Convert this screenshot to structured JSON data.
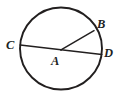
{
  "figure": {
    "kind": "circle-geometry-diagram",
    "background_color": "#ffffff",
    "stroke_color": "#221f1f",
    "canvas": {
      "width": 120,
      "height": 94
    },
    "circle": {
      "name": "circle-A",
      "center_x": 61,
      "center_y": 48.5,
      "radius": 41,
      "stroke_width": 1.9
    },
    "segments": [
      {
        "name": "diameter-CD",
        "from_label": "C",
        "to_label": "D",
        "x1": 20.2,
        "y1": 45.0,
        "x2": 101.8,
        "y2": 54.5,
        "stroke_width": 1.5
      },
      {
        "name": "radius-AB",
        "from_label": "A",
        "to_label": "B",
        "x1": 61,
        "y1": 49.8,
        "x2": 94.0,
        "y2": 30.6,
        "stroke_width": 1.5
      }
    ],
    "points": [
      {
        "name": "point-A",
        "label": "A",
        "x": 61.0,
        "y": 49.8,
        "label_x": 51,
        "label_y": 55,
        "role": "center"
      },
      {
        "name": "point-B",
        "label": "B",
        "x": 94.0,
        "y": 30.6,
        "label_x": 97,
        "label_y": 18,
        "role": "on-circle"
      },
      {
        "name": "point-C",
        "label": "C",
        "x": 20.2,
        "y": 45.0,
        "label_x": 6,
        "label_y": 39,
        "role": "on-circle"
      },
      {
        "name": "point-D",
        "label": "D",
        "x": 101.8,
        "y": 54.5,
        "label_x": 104,
        "label_y": 47,
        "role": "on-circle"
      }
    ],
    "labels": {
      "a": "A",
      "b": "B",
      "c": "C",
      "d": "D"
    }
  }
}
